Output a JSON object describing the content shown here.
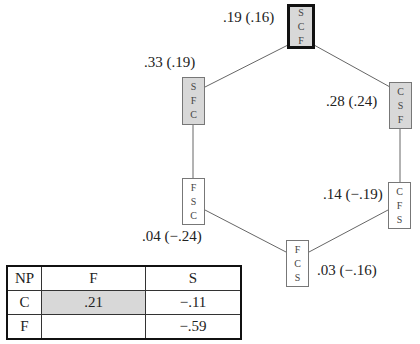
{
  "diagram": {
    "nodes": [
      {
        "id": "SCF",
        "letters": [
          "S",
          "C",
          "F"
        ],
        "label": ".19 (.16)",
        "shaded": true,
        "highlighted": true
      },
      {
        "id": "SFC",
        "letters": [
          "S",
          "F",
          "C"
        ],
        "label": ".33 (.19)",
        "shaded": true,
        "highlighted": false
      },
      {
        "id": "CSF",
        "letters": [
          "C",
          "S",
          "F"
        ],
        "label": ".28 (.24)",
        "shaded": true,
        "highlighted": false
      },
      {
        "id": "FSC",
        "letters": [
          "F",
          "S",
          "C"
        ],
        "label": ".04 (−.24)",
        "shaded": false,
        "highlighted": false
      },
      {
        "id": "CFS",
        "letters": [
          "C",
          "F",
          "S"
        ],
        "label": ".14 (−.19)",
        "shaded": false,
        "highlighted": false
      },
      {
        "id": "FCS",
        "letters": [
          "F",
          "C",
          "S"
        ],
        "label": ".03 (−.16)",
        "shaded": false,
        "highlighted": false
      }
    ],
    "edges": [
      [
        "SCF",
        "SFC"
      ],
      [
        "SCF",
        "CSF"
      ],
      [
        "SFC",
        "FSC"
      ],
      [
        "CSF",
        "CFS"
      ],
      [
        "FSC",
        "FCS"
      ],
      [
        "CFS",
        "FCS"
      ]
    ],
    "colors": {
      "shaded_fill": "#d8d8d8",
      "edge": "#666666",
      "highlight_border": "#111111"
    }
  },
  "table": {
    "headers": [
      "NP",
      "F",
      "S"
    ],
    "rows": [
      {
        "label": "C",
        "F": ".21",
        "S": "−.11",
        "shaded": "F"
      },
      {
        "label": "F",
        "F": "",
        "S": "−.59"
      }
    ]
  }
}
